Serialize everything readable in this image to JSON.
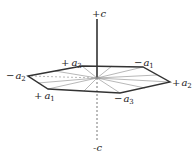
{
  "diagram": {
    "type": "hexagonal-crystal-axes",
    "axes": {
      "c_positive": "+c",
      "c_negative": "-c"
    },
    "labels": {
      "plus_a3": {
        "sign": "+",
        "letter": "a",
        "sub": "3"
      },
      "minus_a1": {
        "sign": "−",
        "letter": "a",
        "sub": "1"
      },
      "minus_a2": {
        "sign": "−",
        "letter": "a",
        "sub": "2"
      },
      "plus_a2": {
        "sign": "+",
        "letter": "a",
        "sub": "2"
      },
      "plus_a1": {
        "sign": "+",
        "letter": "a",
        "sub": "1"
      },
      "minus_a3": {
        "sign": "−",
        "letter": "a",
        "sub": "3"
      }
    },
    "colors": {
      "line": "#333333",
      "thin": "#777777",
      "background": "#ffffff"
    }
  }
}
